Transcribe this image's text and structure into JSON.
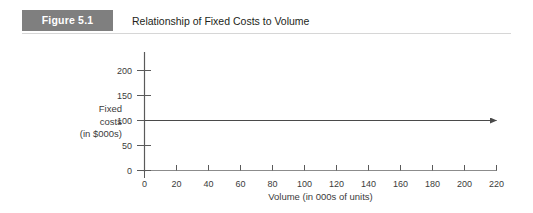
{
  "header": {
    "badge_label": "Figure 5.1",
    "title": "Relationship of Fixed Costs to Volume",
    "badge_color": "#7f7f7f",
    "badge_text_color": "#ffffff",
    "title_color": "#231f20",
    "rule_color": "#d6d6d6"
  },
  "chart_data": {
    "type": "line",
    "title": "Relationship of Fixed Costs to Volume",
    "xlabel": "Volume (in 000s of units)",
    "ylabel": "Fixed costs (in $000s)",
    "ylabel_lines": [
      "Fixed",
      "costs",
      "(in $000s)"
    ],
    "xlim": [
      0,
      220
    ],
    "ylim": [
      0,
      200
    ],
    "xticks": [
      0,
      20,
      40,
      60,
      80,
      100,
      120,
      140,
      160,
      180,
      200,
      220
    ],
    "yticks": [
      0,
      50,
      100,
      150,
      200
    ],
    "xtick_labels": [
      "0",
      "20",
      "40",
      "60",
      "80",
      "100",
      "120",
      "140",
      "160",
      "180",
      "200",
      "220"
    ],
    "ytick_labels": [
      "0",
      "50",
      "100",
      "150",
      "200"
    ],
    "grid": false,
    "legend": null,
    "axis_color": "#5a5a5a",
    "series": [
      {
        "name": "Fixed costs",
        "color": "#4a4a4a",
        "arrow_end": true,
        "x": [
          0,
          220
        ],
        "values": [
          100,
          100
        ]
      }
    ]
  }
}
